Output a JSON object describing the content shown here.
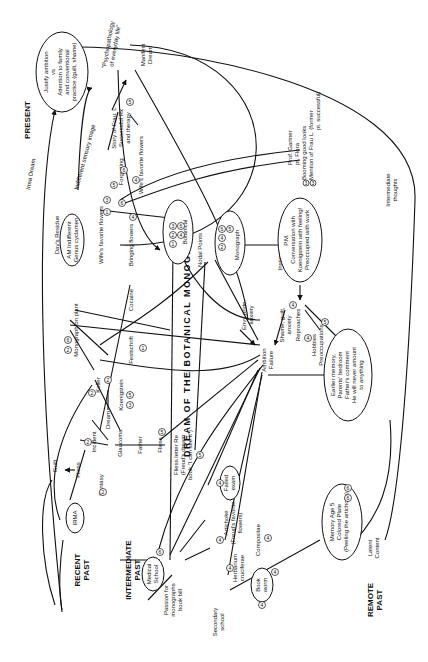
{
  "title": "DREAM OF THE BOTANICAL MONOGRAPH",
  "time_labels": {
    "present": "PRESENT",
    "recent_past": [
      "RECENT",
      "PAST"
    ],
    "intermediate_past": [
      "INTERMEDIATE",
      "PAST"
    ],
    "remote_past": [
      "REMOTE",
      "PAST"
    ]
  },
  "flow_labels": {
    "irma_dream": "Irma Dream",
    "indifferent_sensory_image": "Indifferent sensory image",
    "manifest_dream": [
      "Manifest",
      "Dream"
    ],
    "intermediate_thoughts": [
      "Intermediate",
      "thoughts"
    ],
    "latent_content": [
      "Latent",
      "Content"
    ],
    "nodal_points": "Nodal Points",
    "instigator": "Instigator"
  },
  "nodes": {
    "justify_ambition": [
      "Justify ambition",
      "vs",
      "Attention to family",
      "and conventional",
      "practice (guilt, shame)"
    ],
    "psychopathology": [
      "\"Psychopathology",
      "of everyday life\""
    ],
    "story_frau_l": [
      "Story of Frau. L",
      "Successful Rx",
      "and therapy"
    ],
    "forgetting": "Forgetting",
    "wifes_favorite_flowers_a": "Wife's favorite flowers",
    "wifes_favorite_flowers_b": "Wife's favorite flowers",
    "days_residue": "Day's Residue",
    "am_indifferent": [
      "AM Indifferent",
      "Genus cyclamen"
    ],
    "bringing_flowers": "Bringing flowers",
    "botanical": "Botanical",
    "monograph": "Monograph",
    "prof_gartner": [
      "Prof. Gartner",
      "pt. Flora"
    ],
    "booming_good_looks": "Booming good looks",
    "mention_frau_l": [
      "Mention of Frau L. (former",
      "pt. successful)"
    ],
    "pm_conversation": [
      "P.M.",
      "Conversation with",
      "Koenigstein with feeling!",
      "Preoccupied with work"
    ],
    "monograph_on_plant": "Monograph on plant",
    "cocaine": "Cocaine",
    "festschrift": "Festschrift",
    "koller": "Koller",
    "koenigstein": "Koenigstein",
    "envy_pride": [
      "Envy pride,",
      "anxiety"
    ],
    "reproaches": "Reproaches",
    "shame_guilt": [
      "Shame, guilt,",
      "anxiety"
    ],
    "hobbies": [
      "Hobbies",
      "Preoccupations"
    ],
    "earlier_memory": [
      "Earlier memory,",
      "Parents' bedroom",
      "Father's comment",
      "He will never amount",
      "to anything"
    ],
    "ambition_failure": [
      "Ambition",
      "Failure"
    ],
    "guilt": "Guilt",
    "fliess_a": "Fliess",
    "irma": "IRMA",
    "incident": "Incident",
    "dream": "Dream",
    "fantasy": "Fantasy",
    "glaucoma": "Glaucoma",
    "father": "Father",
    "fliess_b": "Fliess",
    "fliess_letter": [
      "Fliess letter Re",
      "(Freud's dream",
      "book \"I can see it\")"
    ],
    "failed_exam": [
      "Failed",
      "exam"
    ],
    "artichoke": [
      "Artichoke",
      "(Freud's favorite",
      "flowers)"
    ],
    "compositae": "Compositae",
    "medical_school": [
      "Medical",
      "School"
    ],
    "passion_monographs": [
      "Passion for",
      "monographs",
      "book bill"
    ],
    "herbarium": [
      "Herbarium",
      "cruciferae"
    ],
    "book_worm": [
      "Book",
      "worm"
    ],
    "secondary_school": [
      "Secondary",
      "school"
    ],
    "memory_age5": [
      "Memory Age 5",
      "Colored Plate",
      "(Peeling the artichoke)"
    ]
  },
  "numbers": [
    "1",
    "2",
    "3",
    "4",
    "5",
    "6"
  ],
  "colors": {
    "ink": "#111111",
    "paper": "#ffffff"
  }
}
